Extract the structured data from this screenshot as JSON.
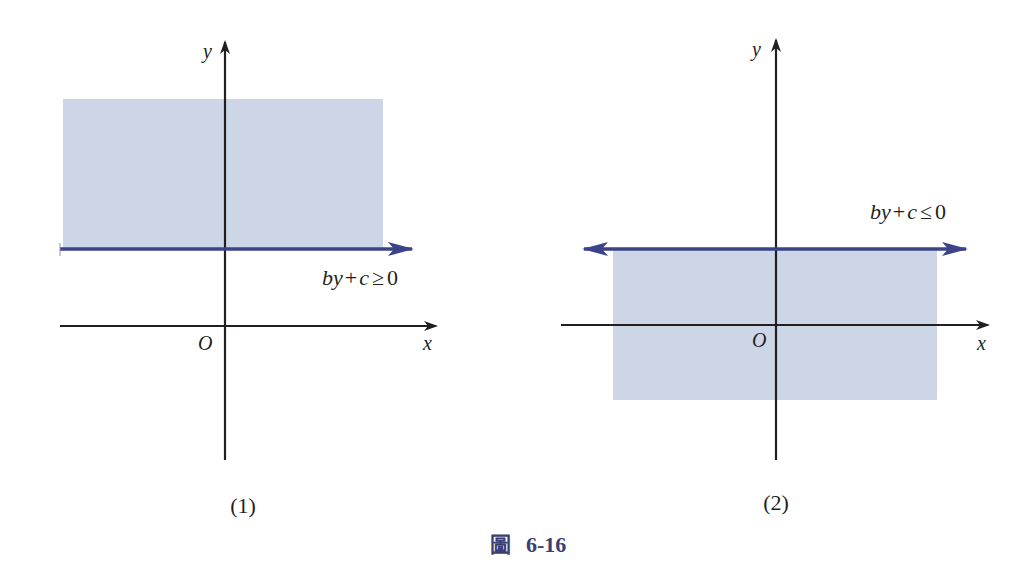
{
  "figure": {
    "caption_prefix": "圖",
    "caption_number": "6-16",
    "colors": {
      "shade": "#cdd6e6",
      "boundary_line": "#3d4388",
      "axis": "#231f20",
      "caption": "#3b3f73"
    }
  },
  "panels": [
    {
      "id": "panel-1",
      "label": "(1)",
      "axis_x_label": "x",
      "axis_y_label": "y",
      "origin_label": "O",
      "inequality": {
        "lhs_b": "b",
        "lhs_y": "y",
        "plus": "+",
        "c": "c",
        "relation": "≥",
        "rhs": "0"
      },
      "shaded_region": "above boundary line"
    },
    {
      "id": "panel-2",
      "label": "(2)",
      "axis_x_label": "x",
      "axis_y_label": "y",
      "origin_label": "O",
      "inequality": {
        "lhs_b": "b",
        "lhs_y": "y",
        "plus": "+",
        "c": "c",
        "relation": "≤",
        "rhs": "0"
      },
      "shaded_region": "below boundary line"
    }
  ]
}
